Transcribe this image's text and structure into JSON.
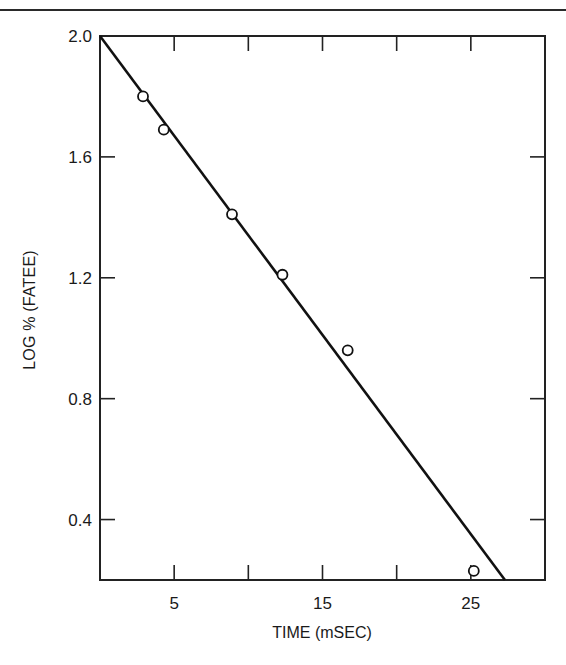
{
  "chart_data": {
    "type": "scatter",
    "title": "",
    "xlabel": "TIME (mSEC)",
    "ylabel": "LOG % (FATEE)",
    "xlim": [
      0,
      30
    ],
    "ylim": [
      0.2,
      2.0
    ],
    "x_ticks": [
      5,
      10,
      15,
      20,
      25
    ],
    "x_tick_labels": [
      "5",
      "15",
      "25"
    ],
    "y_ticks": [
      2.0,
      1.6,
      1.2,
      0.8,
      0.4
    ],
    "y_tick_labels": [
      "2.0",
      "1.6",
      "1.2",
      "0.8",
      "0.4"
    ],
    "grid": false,
    "legend": null,
    "series": [
      {
        "name": "observed",
        "marker": "open-circle",
        "x": [
          2.9,
          4.3,
          8.9,
          12.3,
          16.7,
          25.2
        ],
        "y": [
          1.8,
          1.69,
          1.41,
          1.21,
          0.96,
          0.23
        ]
      },
      {
        "name": "fit line",
        "type": "line",
        "x": [
          0,
          27.3
        ],
        "y": [
          2.0,
          0.2
        ]
      }
    ]
  }
}
